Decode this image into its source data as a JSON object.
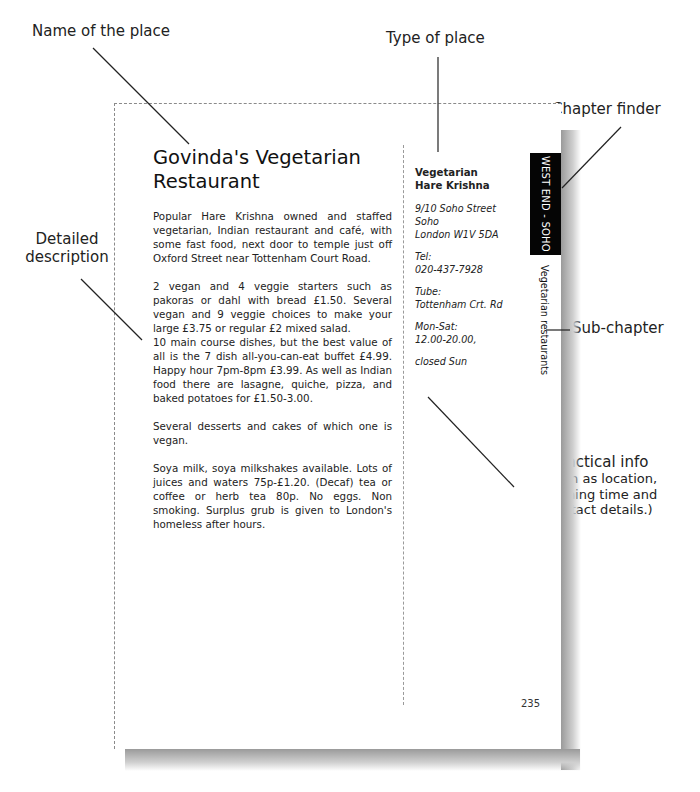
{
  "annotations": {
    "name_of_place": "Name of the place",
    "type_of_place": "Type of place",
    "chapter_finder": "Chapter finder",
    "detailed_description_line1": "Detailed",
    "detailed_description_line2": "description",
    "sub_chapter": "Sub-chapter",
    "practical_info_title": "Practical info",
    "practical_info_line1": "(such as location,",
    "practical_info_line2": "opening time and",
    "practical_info_line3": "contact details.)"
  },
  "page": {
    "title": "Govinda's Vegetarian Restaurant",
    "paragraphs": [
      "Popular Hare Krishna owned and staffed vegetarian, Indian restaurant and café, with some fast food, next door to temple just off Oxford Street near Tottenham Court Road.",
      "2 vegan and 4 veggie starters such as pakoras or dahl with bread £1.50.  Several vegan and 9 veggie choices to make your large £3.75 or regular £2 mixed salad.",
      "10 main course dishes, but the best value of all is the 7 dish all-you-can-eat buffet £4.99.  Happy hour 7pm-8pm £3.99.  As well as Indian food there are lasagne, quiche, pizza, and baked potatoes for £1.50-3.00.",
      "Several desserts and cakes of which one is vegan.",
      "Soya milk, soya milkshakes available.  Lots of juices and waters 75p-£1.20.  (Decaf) tea or coffee or herb tea 80p.  No eggs.  Non smoking.  Surplus grub is given to London's homeless after hours."
    ],
    "sidebar": {
      "type_line1": "Vegetarian",
      "type_line2": "Hare Krishna",
      "address_line1": "9/10 Soho Street",
      "address_line2": "Soho",
      "address_line3": "London W1V 5DA",
      "tel_label": "Tel:",
      "tel_value": "020-437-7928",
      "tube_label": "Tube:",
      "tube_value": "Tottenham Crt. Rd",
      "hours_label": "Mon-Sat:",
      "hours_value": "12.00-20.00,",
      "closed": "closed Sun"
    },
    "chapter_tab": "WEST END - SOHO",
    "subchapter": "Vegetarian restaurants",
    "page_number": "235"
  },
  "colors": {
    "chapter_tab_bg": "#050505",
    "chapter_tab_text": "#ffffff",
    "text": "#222222"
  }
}
